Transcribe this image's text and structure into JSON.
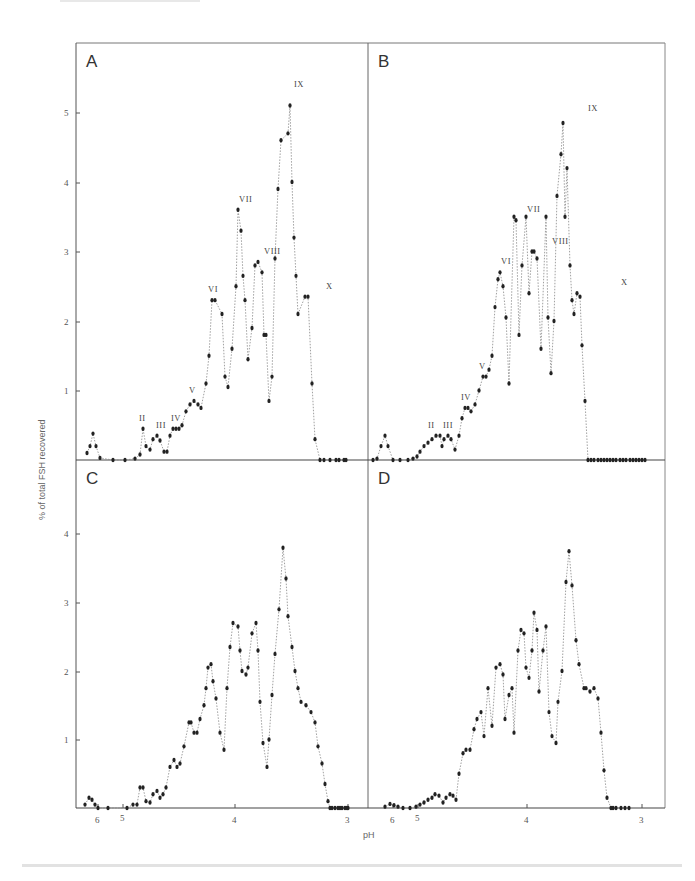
{
  "figure": {
    "y_axis_title": "% of total FSH recovered",
    "x_axis_title": "pH"
  },
  "chart_data": [
    {
      "type": "line",
      "panel": "A",
      "xlabel": "pH",
      "ylabel": "% of total FSH recovered",
      "ylim": [
        0,
        5.6
      ],
      "yticks": [
        1,
        2,
        3,
        4,
        5
      ],
      "xticks": [
        "6",
        "5",
        "4",
        "3"
      ],
      "peak_labels": [
        {
          "label": "II",
          "x_px": 143,
          "value": 0.45
        },
        {
          "label": "III",
          "x_px": 160,
          "value": 0.35
        },
        {
          "label": "IV",
          "x_px": 175,
          "value": 0.45
        },
        {
          "label": "V",
          "x_px": 193,
          "value": 0.85
        },
        {
          "label": "VI",
          "x_px": 212,
          "value": 2.3
        },
        {
          "label": "VII",
          "x_px": 243,
          "value": 3.6
        },
        {
          "label": "VIII",
          "x_px": 268,
          "value": 2.85
        },
        {
          "label": "IX",
          "x_px": 298,
          "value": 5.25
        },
        {
          "label": "X",
          "x_px": 330,
          "value": 2.35
        }
      ],
      "points_px_x": [
        87,
        90,
        93,
        96,
        100,
        113,
        125,
        135,
        140,
        143,
        146,
        150,
        153,
        157,
        160,
        164,
        167,
        170,
        173,
        176,
        179,
        182,
        186,
        190,
        194,
        198,
        201,
        206,
        209,
        212,
        215,
        222,
        225,
        228,
        232,
        236,
        238,
        241,
        243,
        245,
        248,
        252,
        255,
        258,
        262,
        264,
        266,
        269,
        272,
        275,
        278,
        281,
        288,
        290,
        292,
        294,
        296,
        298,
        305,
        308,
        312,
        315,
        320,
        324,
        330,
        336,
        339,
        344,
        346
      ],
      "values": [
        0.1,
        0.2,
        0.38,
        0.2,
        0.03,
        0.0,
        0.0,
        0.02,
        0.08,
        0.45,
        0.2,
        0.15,
        0.3,
        0.35,
        0.28,
        0.12,
        0.12,
        0.35,
        0.45,
        0.45,
        0.45,
        0.5,
        0.7,
        0.8,
        0.85,
        0.8,
        0.75,
        1.1,
        1.5,
        2.3,
        2.3,
        2.1,
        1.2,
        1.05,
        1.6,
        2.5,
        3.6,
        3.3,
        2.65,
        2.3,
        1.45,
        1.9,
        2.8,
        2.85,
        2.7,
        1.8,
        1.8,
        0.85,
        1.2,
        2.9,
        3.9,
        4.6,
        4.7,
        5.1,
        4.0,
        3.2,
        2.65,
        2.1,
        2.35,
        2.35,
        1.1,
        0.3,
        0.0,
        0.0,
        0.0,
        0.0,
        0.0,
        0.0,
        0.0
      ],
      "note": "Values estimated from pixel positions; irregular isoelectric-focusing profile with labelled peaks I–X."
    },
    {
      "type": "line",
      "panel": "B",
      "xlabel": "pH",
      "ylabel": "% of total FSH recovered",
      "ylim": [
        0,
        5.6
      ],
      "yticks": [
        1,
        2,
        3,
        4,
        5
      ],
      "xticks": [
        "6",
        "5",
        "4",
        "3"
      ],
      "peak_labels": [
        {
          "label": "II",
          "x_px": 432,
          "value": 0.35
        },
        {
          "label": "III",
          "x_px": 447,
          "value": 0.35
        },
        {
          "label": "IV",
          "x_px": 465,
          "value": 0.75
        },
        {
          "label": "V",
          "x_px": 483,
          "value": 1.2
        },
        {
          "label": "VI",
          "x_px": 505,
          "value": 2.7
        },
        {
          "label": "VII",
          "x_px": 531,
          "value": 3.45
        },
        {
          "label": "VIII",
          "x_px": 556,
          "value": 3.0
        },
        {
          "label": "IX",
          "x_px": 592,
          "value": 4.9
        },
        {
          "label": "X",
          "x_px": 625,
          "value": 2.4
        }
      ],
      "points_px_x": [
        373,
        377,
        381,
        385,
        388,
        393,
        400,
        408,
        413,
        417,
        420,
        424,
        428,
        432,
        436,
        440,
        442,
        444,
        448,
        451,
        455,
        459,
        462,
        465,
        468,
        471,
        475,
        479,
        483,
        486,
        489,
        492,
        495,
        498,
        500,
        503,
        506,
        509,
        514,
        516,
        519,
        522,
        526,
        529,
        532,
        534,
        537,
        541,
        546,
        548,
        551,
        554,
        557,
        561,
        563,
        565,
        567,
        570,
        572,
        574,
        577,
        580,
        582,
        585,
        588,
        591,
        594,
        598,
        601,
        604,
        607,
        610,
        613,
        616,
        620,
        623,
        626,
        630,
        633,
        636,
        639,
        642,
        645
      ],
      "values": [
        0.0,
        0.02,
        0.2,
        0.35,
        0.2,
        0.0,
        0.0,
        0.0,
        0.02,
        0.05,
        0.12,
        0.2,
        0.25,
        0.3,
        0.35,
        0.35,
        0.2,
        0.3,
        0.35,
        0.3,
        0.15,
        0.35,
        0.6,
        0.75,
        0.75,
        0.7,
        0.8,
        1.0,
        1.2,
        1.2,
        1.3,
        1.5,
        2.2,
        2.6,
        2.7,
        2.5,
        2.05,
        1.1,
        3.5,
        3.45,
        1.8,
        2.8,
        3.5,
        2.4,
        3.0,
        3.0,
        2.9,
        1.6,
        3.5,
        2.05,
        1.25,
        2.0,
        3.8,
        4.4,
        4.85,
        3.5,
        4.2,
        2.8,
        2.3,
        2.1,
        2.4,
        2.35,
        1.65,
        0.85,
        0.0,
        0.0,
        0.0,
        0.0,
        0.0,
        0.0,
        0.0,
        0.0,
        0.0,
        0.0,
        0.0,
        0.0,
        0.0,
        0.0,
        0.0,
        0.0,
        0.0,
        0.0,
        0.0
      ],
      "note": "Values estimated from pixel positions."
    },
    {
      "type": "line",
      "panel": "C",
      "xlabel": "pH",
      "ylabel": "% of total FSH recovered",
      "ylim": [
        0,
        5.0
      ],
      "yticks": [
        1,
        2,
        3,
        4
      ],
      "xticks": [
        "6",
        "5",
        "4",
        "3"
      ],
      "points_px_x": [
        85,
        89,
        92,
        95,
        98,
        108,
        127,
        133,
        137,
        140,
        143,
        146,
        150,
        153,
        157,
        160,
        163,
        166,
        170,
        174,
        177,
        180,
        184,
        189,
        191,
        194,
        197,
        200,
        204,
        206,
        208,
        211,
        213,
        216,
        220,
        224,
        227,
        230,
        233,
        238,
        240,
        242,
        246,
        248,
        252,
        256,
        258,
        260,
        263,
        267,
        269,
        272,
        275,
        279,
        283,
        286,
        288,
        292,
        295,
        298,
        301,
        306,
        311,
        315,
        318,
        322,
        325,
        328,
        330,
        332,
        335,
        338,
        340,
        342,
        345,
        347,
        348
      ],
      "values": [
        0.05,
        0.15,
        0.12,
        0.05,
        0.0,
        0.0,
        0.0,
        0.05,
        0.05,
        0.3,
        0.3,
        0.1,
        0.08,
        0.2,
        0.25,
        0.15,
        0.2,
        0.3,
        0.6,
        0.7,
        0.6,
        0.65,
        0.9,
        1.25,
        1.25,
        1.1,
        1.1,
        1.3,
        1.5,
        1.75,
        2.05,
        2.1,
        1.85,
        1.6,
        1.1,
        0.85,
        1.75,
        2.35,
        2.7,
        2.65,
        2.3,
        2.0,
        1.95,
        2.05,
        2.55,
        2.7,
        2.3,
        1.55,
        0.95,
        0.6,
        1.0,
        1.65,
        2.25,
        2.9,
        3.8,
        3.35,
        2.8,
        2.35,
        2.0,
        1.75,
        1.55,
        1.5,
        1.4,
        1.25,
        0.9,
        0.65,
        0.35,
        0.1,
        0.0,
        0.0,
        0.0,
        0.0,
        0.0,
        0.0,
        0.0,
        0.0,
        0.0
      ],
      "note": "Values estimated from pixel positions."
    },
    {
      "type": "line",
      "panel": "D",
      "xlabel": "pH",
      "ylabel": "% of total FSH recovered",
      "ylim": [
        0,
        5.0
      ],
      "yticks": [
        1,
        2,
        3,
        4
      ],
      "xticks": [
        "6",
        "5",
        "4",
        "3"
      ],
      "points_px_x": [
        385,
        390,
        394,
        398,
        403,
        410,
        416,
        420,
        424,
        428,
        432,
        435,
        439,
        443,
        446,
        450,
        453,
        456,
        459,
        463,
        466,
        470,
        474,
        477,
        481,
        484,
        488,
        492,
        496,
        500,
        503,
        505,
        509,
        512,
        514,
        518,
        521,
        524,
        526,
        529,
        532,
        534,
        537,
        539,
        543,
        546,
        549,
        552,
        556,
        558,
        562,
        566,
        569,
        572,
        576,
        579,
        584,
        586,
        590,
        594,
        598,
        601,
        604,
        607,
        611,
        613,
        616,
        621,
        625,
        629
      ],
      "values": [
        0.02,
        0.06,
        0.04,
        0.02,
        0.0,
        0.0,
        0.02,
        0.05,
        0.08,
        0.12,
        0.15,
        0.2,
        0.18,
        0.08,
        0.15,
        0.2,
        0.18,
        0.12,
        0.5,
        0.8,
        0.85,
        0.85,
        1.15,
        1.3,
        1.4,
        1.05,
        1.75,
        1.2,
        2.05,
        2.1,
        1.95,
        1.3,
        1.65,
        1.75,
        1.1,
        2.3,
        2.6,
        2.55,
        2.05,
        1.9,
        2.3,
        2.85,
        2.6,
        1.7,
        2.3,
        2.65,
        1.4,
        1.05,
        0.95,
        1.55,
        2.0,
        3.3,
        3.75,
        3.25,
        2.45,
        2.1,
        1.75,
        1.75,
        1.7,
        1.75,
        1.6,
        1.1,
        0.55,
        0.15,
        0.0,
        0.0,
        0.0,
        0.0,
        0.0,
        0.0
      ],
      "note": "Values estimated from pixel positions."
    }
  ]
}
